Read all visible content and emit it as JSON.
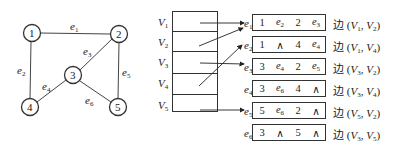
{
  "graph": {
    "vertices": [
      {
        "id": "1",
        "x": 32,
        "y": 33
      },
      {
        "id": "2",
        "x": 119,
        "y": 34
      },
      {
        "id": "3",
        "x": 73,
        "y": 75
      },
      {
        "id": "4",
        "x": 30,
        "y": 107
      },
      {
        "id": "5",
        "x": 118,
        "y": 107
      }
    ],
    "edges": [
      {
        "name": "e",
        "sub": "1",
        "from": "1",
        "to": "2"
      },
      {
        "name": "e",
        "sub": "2",
        "from": "1",
        "to": "4"
      },
      {
        "name": "e",
        "sub": "3",
        "from": "3",
        "to": "2"
      },
      {
        "name": "e",
        "sub": "4",
        "from": "3",
        "to": "4"
      },
      {
        "name": "e",
        "sub": "5",
        "from": "2",
        "to": "5"
      },
      {
        "name": "e",
        "sub": "6",
        "from": "3",
        "to": "5"
      }
    ]
  },
  "vertex_table": {
    "rows": [
      {
        "name": "V",
        "sub": "1"
      },
      {
        "name": "V",
        "sub": "2"
      },
      {
        "name": "V",
        "sub": "3"
      },
      {
        "name": "V",
        "sub": "4"
      },
      {
        "name": "V",
        "sub": "5"
      }
    ]
  },
  "edge_table": {
    "rows": [
      {
        "edge": "e",
        "edge_sub": "1",
        "cells": [
          {
            "t": "1"
          },
          {
            "t": "e",
            "s": "2"
          },
          {
            "t": "2"
          },
          {
            "t": "e",
            "s": "3"
          }
        ],
        "label": "边",
        "pair": [
          "V",
          "1",
          "V",
          "2"
        ]
      },
      {
        "edge": "e",
        "edge_sub": "2",
        "cells": [
          {
            "t": "1"
          },
          {
            "t": "∧"
          },
          {
            "t": "4"
          },
          {
            "t": "e",
            "s": "4"
          }
        ],
        "label": "边",
        "pair": [
          "V",
          "1",
          "V",
          "4"
        ]
      },
      {
        "edge": "e",
        "edge_sub": "3",
        "cells": [
          {
            "t": "3"
          },
          {
            "t": "e",
            "s": "4"
          },
          {
            "t": "2"
          },
          {
            "t": "e",
            "s": "5"
          }
        ],
        "label": "边",
        "pair": [
          "V",
          "3",
          "V",
          "2"
        ]
      },
      {
        "edge": "e",
        "edge_sub": "4",
        "cells": [
          {
            "t": "3"
          },
          {
            "t": "e",
            "s": "6"
          },
          {
            "t": "4"
          },
          {
            "t": "∧"
          }
        ],
        "label": "边",
        "pair": [
          "V",
          "3",
          "V",
          "4"
        ]
      },
      {
        "edge": "e",
        "edge_sub": "5",
        "cells": [
          {
            "t": "5"
          },
          {
            "t": "e",
            "s": "6"
          },
          {
            "t": "2"
          },
          {
            "t": "∧"
          }
        ],
        "label": "边",
        "pair": [
          "V",
          "5",
          "V",
          "2"
        ]
      },
      {
        "edge": "e",
        "edge_sub": "6",
        "cells": [
          {
            "t": "3"
          },
          {
            "t": "∧"
          },
          {
            "t": "5"
          },
          {
            "t": "∧"
          }
        ],
        "label": "边",
        "pair": [
          "V",
          "3",
          "V",
          "5"
        ]
      }
    ]
  },
  "pointers": [
    {
      "from_vertex": "V1",
      "to_edge": "e1"
    },
    {
      "from_vertex": "V2",
      "to_edge": "e1"
    },
    {
      "from_vertex": "V3",
      "to_edge": "e3"
    },
    {
      "from_vertex": "V4",
      "to_edge": "e2"
    },
    {
      "from_vertex": "V5",
      "to_edge": "e5"
    }
  ]
}
